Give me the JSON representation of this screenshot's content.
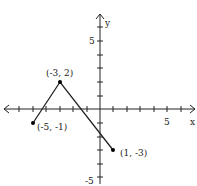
{
  "graph": {
    "axes": {
      "x_label": "x",
      "y_label": "y",
      "x_tick_label": "5",
      "y_tick_label_pos": "5",
      "y_tick_label_neg": "-5",
      "xrange": [
        -7,
        6
      ],
      "yrange": [
        -5,
        6
      ]
    },
    "points": [
      {
        "label": "(-5, -1)",
        "x": -5,
        "y": -1
      },
      {
        "label": "(-3, 2)",
        "x": -3,
        "y": 2
      },
      {
        "label": "(1, -3)",
        "x": 1,
        "y": -3
      }
    ],
    "colors": {
      "line": "#222222",
      "axis": "#222222"
    }
  }
}
